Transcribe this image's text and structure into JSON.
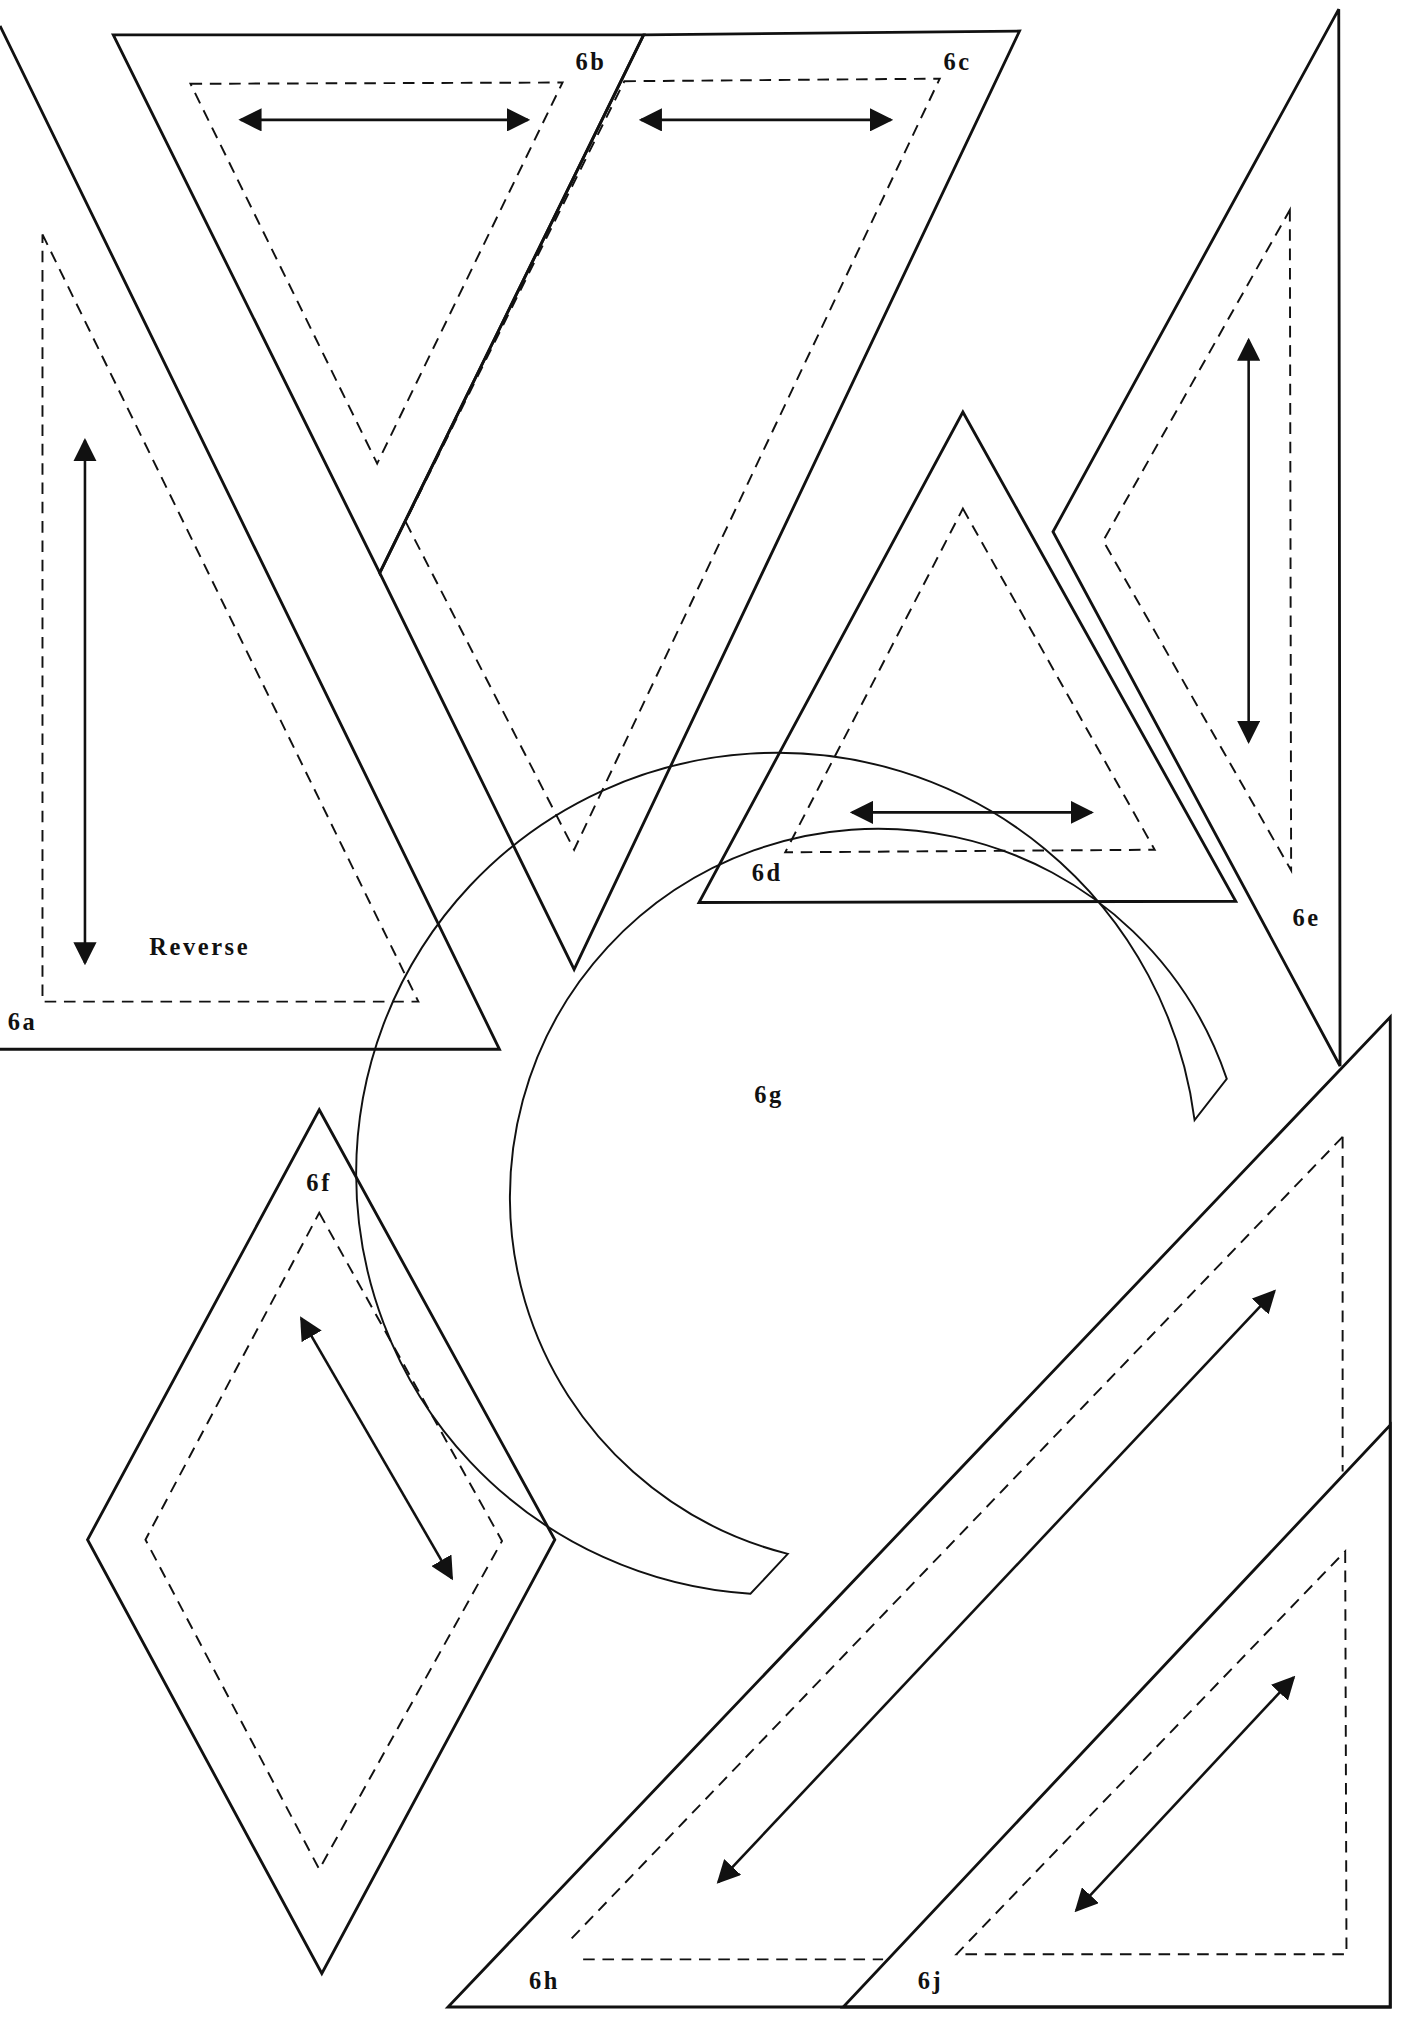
{
  "pieces": {
    "6a": {
      "label": "6a",
      "note": "Reverse"
    },
    "6b": {
      "label": "6b"
    },
    "6c": {
      "label": "6c"
    },
    "6d": {
      "label": "6d"
    },
    "6e": {
      "label": "6e"
    },
    "6f": {
      "label": "6f"
    },
    "6g": {
      "label": "6g"
    },
    "6h": {
      "label": "6h"
    },
    "6j": {
      "label": "6j"
    }
  },
  "colors": {
    "stroke": "#111111",
    "background": "#ffffff"
  }
}
